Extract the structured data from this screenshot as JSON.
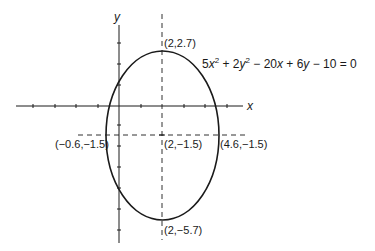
{
  "diagram": {
    "type": "ellipse-graph",
    "axes": {
      "x_label": "x",
      "y_label": "y"
    },
    "equation": {
      "text": "5x² + 2y² − 20x + 6y − 10 = 0",
      "parts": {
        "c1": "5",
        "v1": "x",
        "e1": "2",
        "op1": " + 2",
        "v2": "y",
        "e2": "2",
        "op2": " − 20",
        "v3": "x",
        "op3": " + 6",
        "v4": "y",
        "rest": " − 10 = 0"
      }
    },
    "points": {
      "top": "(2,2.7)",
      "center": "(2,−1.5)",
      "left": "(−0.6,−1.5)",
      "right": "(4.6,−1.5)",
      "bottom": "(2,−5.7)"
    },
    "ellipse": {
      "center": [
        2,
        -1.5
      ],
      "semi_major_y": 4.2,
      "semi_minor_x": 2.6
    },
    "colors": {
      "stroke": "#1a1a1a",
      "background": "#ffffff"
    }
  }
}
